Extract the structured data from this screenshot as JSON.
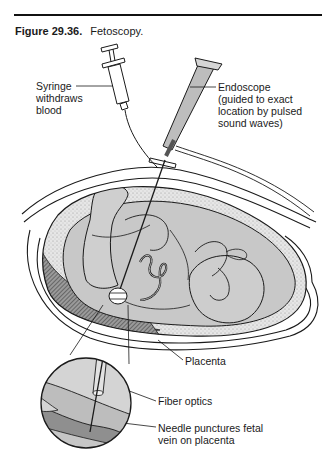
{
  "figure": {
    "number": "Figure 29.36.",
    "title": "Fetoscopy."
  },
  "labels": {
    "syringe": [
      "Syringe",
      "withdraws",
      "blood"
    ],
    "endoscope": [
      "Endoscope",
      "(guided to exact",
      "location by pulsed",
      "sound waves)"
    ],
    "placenta": "Placenta",
    "fiber_optics": "Fiber optics",
    "needle": [
      "Needle punctures fetal",
      "vein on placenta"
    ]
  },
  "colors": {
    "ink": "#1a1a1a",
    "fill_gray": "#c8c8c8",
    "fill_light": "#d9d9d9",
    "fill_dark": "#8a8a8a",
    "stipple": "#e2e2e2",
    "background": "#ffffff"
  }
}
